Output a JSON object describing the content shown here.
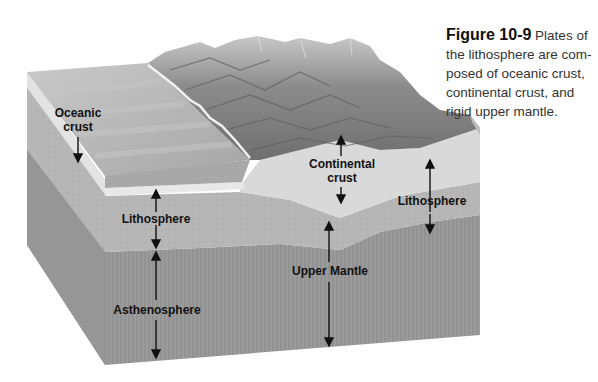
{
  "caption": {
    "figure_number": "Figure 10-9",
    "text": " Plates of the lithosphere are com-posed of oceanic crust, continental crust, and rigid upper mantle."
  },
  "labels": {
    "oceanic_crust_line1": "Oceanic",
    "oceanic_crust_line2": "crust",
    "continental_crust_line1": "Continental",
    "continental_crust_line2": "crust",
    "lithosphere_left": "Lithosphere",
    "lithosphere_right": "Lithosphere",
    "asthenosphere": "Asthenosphere",
    "upper_mantle": "Upper Mantle"
  },
  "colors": {
    "background": "#ffffff",
    "ocean_top": "#b8b8b8",
    "ocean_face": "#a9a9a9",
    "oceanic_crust_band": "#e6e6e6",
    "continental_crust": "#dadada",
    "lithosphere_mantle": "#b4b4b4",
    "asthenosphere": "#979797",
    "side_face": "#9c9c9c",
    "mountains": "#8a8a8a",
    "arrow": "#111111"
  }
}
